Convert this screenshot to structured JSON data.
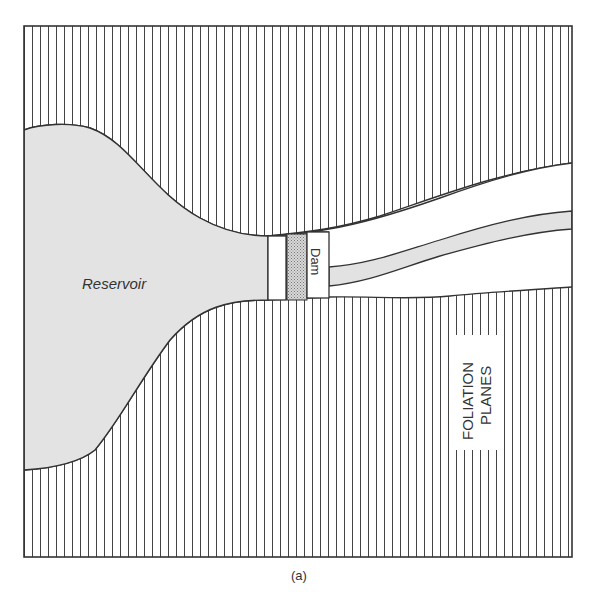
{
  "figure": {
    "caption": "(a)",
    "labels": {
      "reservoir": "Reservoir",
      "dam": "Dam",
      "foliation_line1": "FOLIATION",
      "foliation_line2": "PLANES"
    }
  },
  "colors": {
    "ink": "#333333",
    "reservoir_fill": "#e2e2e2",
    "dam_fill": "#bdbdbd",
    "background": "#ffffff"
  }
}
